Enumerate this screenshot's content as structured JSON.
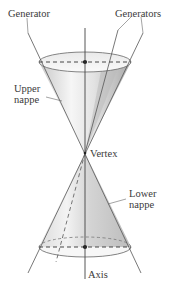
{
  "figure": {
    "type": "double-napped right circular cone",
    "labels": {
      "generator": "Generator",
      "generators": "Generators",
      "upper_nappe_line1": "Upper",
      "upper_nappe_line2": "nappe",
      "vertex": "Vertex",
      "lower_nappe_line1": "Lower",
      "lower_nappe_line2": "nappe",
      "axis": "Axis"
    },
    "colors": {
      "line": "#555555",
      "shade_dark": "#bdbdbd",
      "shade_light": "#f4f4f4",
      "background": "#ffffff"
    }
  }
}
